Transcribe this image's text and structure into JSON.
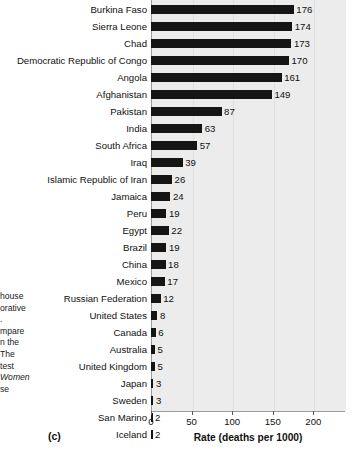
{
  "panel": {
    "letter": "(c)"
  },
  "caption_fragment": {
    "lines": [
      {
        "text": "house",
        "italic": false
      },
      {
        "text": "orative",
        "italic": false
      },
      {
        "text": ".",
        "italic": false
      },
      {
        "text": "mpare",
        "italic": false
      },
      {
        "text": "n the",
        "italic": false
      },
      {
        "text": "The",
        "italic": false
      },
      {
        "text": "test",
        "italic": false
      },
      {
        "text": "Women",
        "italic": true
      },
      {
        "text": "se",
        "italic": false
      }
    ]
  },
  "chart_data": {
    "type": "bar",
    "orientation": "horizontal",
    "title": "",
    "subtitle": "",
    "xlabel": "Rate (deaths per 1000)",
    "ylabel": "",
    "xlim": [
      0,
      239
    ],
    "xticks": [
      0,
      50,
      100,
      150,
      200
    ],
    "xtick_labels": [
      "0",
      "50",
      "100",
      "150",
      "200"
    ],
    "grid": "vertical",
    "legend": "none",
    "bar_color": "#151515",
    "plot_background": "#ececec",
    "categories": [
      "Burkina Faso",
      "Sierra Leone",
      "Chad",
      "Democratic Republic of Congo",
      "Angola",
      "Afghanistan",
      "Pakistan",
      "India",
      "South Africa",
      "Iraq",
      "Islamic Republic of Iran",
      "Jamaica",
      "Peru",
      "Egypt",
      "Brazil",
      "China",
      "Mexico",
      "Russian Federation",
      "United States",
      "Canada",
      "Australia",
      "United Kingdom",
      "Japan",
      "Sweden",
      "San Marino",
      "Iceland"
    ],
    "values": [
      176,
      174,
      173,
      170,
      161,
      149,
      87,
      63,
      57,
      39,
      26,
      24,
      19,
      22,
      19,
      18,
      17,
      12,
      8,
      6,
      5,
      5,
      3,
      3,
      2,
      2
    ],
    "value_labels": [
      "176",
      "174",
      "173",
      "170",
      "161",
      "149",
      "87",
      "63",
      "57",
      "39",
      "26",
      "24",
      "19",
      "22",
      "19",
      "18",
      "17",
      "12",
      "8",
      "6",
      "5",
      "5",
      "3",
      "3",
      "2",
      "2"
    ]
  }
}
